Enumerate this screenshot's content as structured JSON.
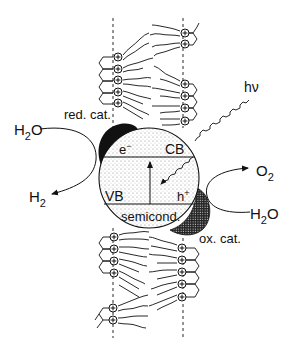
{
  "diagram": {
    "labels": {
      "red_cat": "red. cat.",
      "ox_cat": "ox. cat.",
      "hv": "hν",
      "electron": "e",
      "electron_sup": "−",
      "cb": "CB",
      "vb": "VB",
      "hole": "h",
      "hole_sup": "+",
      "semicond": "semicond.",
      "h2o_left": "H",
      "h2o_left_sub": "2",
      "h2o_left_o": "O",
      "h2": "H",
      "h2_sub": "2",
      "o2": "O",
      "o2_sub": "2",
      "h2o_right": "H",
      "h2o_right_sub": "2",
      "h2o_right_o": "O"
    },
    "headgroup_symbol": "+",
    "colors": {
      "ink": "#111111",
      "background": "#ffffff",
      "red_cat_fill": "#111111",
      "semiconductor_fill": "#f4f4f4"
    }
  }
}
